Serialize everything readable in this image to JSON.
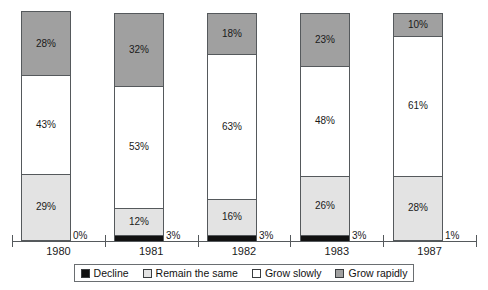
{
  "chart_data": {
    "type": "bar",
    "subtype": "stacked-bar-100",
    "title": "",
    "xlabel": "",
    "ylabel": "",
    "ylim": [
      0,
      100
    ],
    "grid": false,
    "legend_position": "bottom",
    "categories": [
      "1980",
      "1981",
      "1982",
      "1983",
      "1987"
    ],
    "series": [
      {
        "name": "Decline",
        "color": "#111111",
        "values": [
          0,
          3,
          3,
          3,
          1
        ],
        "labels": [
          "0%",
          "3%",
          "3%",
          "3%",
          "1%"
        ],
        "label_placement": "outside-right"
      },
      {
        "name": "Remain the same",
        "color": "#e3e3e3",
        "values": [
          29,
          12,
          16,
          26,
          28
        ],
        "labels": [
          "29%",
          "12%",
          "16%",
          "26%",
          "28%"
        ],
        "label_placement": "inside"
      },
      {
        "name": "Grow slowly",
        "color": "#ffffff",
        "values": [
          43,
          53,
          63,
          48,
          61
        ],
        "labels": [
          "43%",
          "53%",
          "63%",
          "48%",
          "61%"
        ],
        "label_placement": "inside"
      },
      {
        "name": "Grow rapidly",
        "color": "#a0a0a0",
        "values": [
          28,
          32,
          18,
          23,
          10
        ],
        "labels": [
          "28%",
          "32%",
          "18%",
          "23%",
          "10%"
        ],
        "label_placement": "inside"
      }
    ]
  },
  "axis": {
    "tick_labels": [
      "1980",
      "1981",
      "1982",
      "1983",
      "1987"
    ]
  },
  "legend": {
    "items": [
      {
        "label": "Decline",
        "color": "#111111"
      },
      {
        "label": "Remain the same",
        "color": "#e3e3e3"
      },
      {
        "label": "Grow slowly",
        "color": "#ffffff"
      },
      {
        "label": "Grow rapidly",
        "color": "#a0a0a0"
      }
    ]
  }
}
